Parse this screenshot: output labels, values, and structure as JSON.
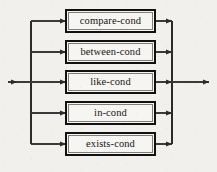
{
  "diagram": {
    "type": "railroad-syntax-diagram",
    "background_color": "#f2f0ec",
    "line_color": "#2b2b2b",
    "box_border_color": "#111111",
    "box_fill_color": "#f7f5f2",
    "text_color": "#16140f",
    "canvas": {
      "width": 217,
      "height": 172
    },
    "entry": {
      "label": "",
      "arrow": "entry-arrow",
      "x_start": 8,
      "x_end": 66,
      "y": 82
    },
    "exit": {
      "label": "",
      "arrow": "exit-arrow",
      "x_start": 172,
      "x_end": 209,
      "y": 82
    },
    "left_bus_x": 31,
    "right_bus_x": 172,
    "box_left": 66,
    "box_right": 155,
    "branches": [
      {
        "id": "compare-cond",
        "label": "compare-cond",
        "y": 21,
        "box_top": 10,
        "box_height": 22
      },
      {
        "id": "between-cond",
        "label": "between-cond",
        "y": 52,
        "box_top": 41,
        "box_height": 22
      },
      {
        "id": "like-cond",
        "label": "like-cond",
        "y": 82,
        "box_top": 71,
        "box_height": 22
      },
      {
        "id": "in-cond",
        "label": "in-cond",
        "y": 113,
        "box_top": 102,
        "box_height": 22
      },
      {
        "id": "exists-cond",
        "label": "exists-cond",
        "y": 144,
        "box_top": 133,
        "box_height": 22
      }
    ]
  }
}
